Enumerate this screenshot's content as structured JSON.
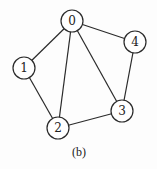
{
  "figure": {
    "caption": "(b)",
    "stroke_color": "#2a2a2a",
    "node_fill": "#ffffff",
    "node_radius": 11,
    "nodes": [
      {
        "id": "0",
        "label": "0",
        "x": 72,
        "y": 21
      },
      {
        "id": "1",
        "label": "1",
        "x": 24,
        "y": 68
      },
      {
        "id": "2",
        "label": "2",
        "x": 58,
        "y": 128
      },
      {
        "id": "3",
        "label": "3",
        "x": 122,
        "y": 111
      },
      {
        "id": "4",
        "label": "4",
        "x": 135,
        "y": 42
      }
    ],
    "edges": [
      {
        "from": "0",
        "to": "1"
      },
      {
        "from": "0",
        "to": "2"
      },
      {
        "from": "0",
        "to": "3"
      },
      {
        "from": "0",
        "to": "4"
      },
      {
        "from": "1",
        "to": "2"
      },
      {
        "from": "2",
        "to": "3"
      },
      {
        "from": "3",
        "to": "4"
      }
    ]
  }
}
